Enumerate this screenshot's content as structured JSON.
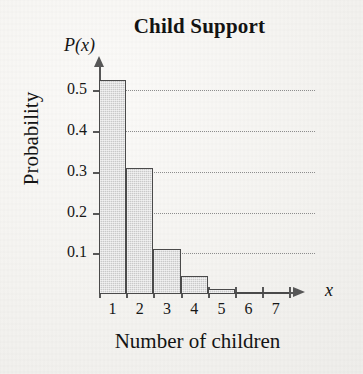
{
  "chart_data": {
    "type": "bar",
    "title": "Child Support",
    "xlabel": "Number of children",
    "ylabel": "Probability",
    "x_var_label": "x",
    "y_var_label": "P(x)",
    "categories": [
      "1",
      "2",
      "3",
      "4",
      "5",
      "6",
      "7"
    ],
    "values": [
      0.525,
      0.31,
      0.11,
      0.045,
      0.012,
      0.006,
      0.0
    ],
    "ylim": [
      0,
      0.56
    ],
    "xlim": [
      0.5,
      7.5
    ],
    "y_ticks": [
      0.1,
      0.2,
      0.3,
      0.4,
      0.5
    ],
    "y_tick_labels": [
      "0.1",
      "0.2",
      "0.3",
      "0.4",
      "0.5"
    ],
    "x_ticks": [
      1,
      2,
      3,
      4,
      5,
      6,
      7
    ],
    "x_tick_labels": [
      "1",
      "2",
      "3",
      "4",
      "5",
      "6",
      "7"
    ],
    "grid": true,
    "grid_axis": "y",
    "legend": null,
    "bar_fill_color": "#c9c9c9",
    "bar_edge_color": "#4a4a4a",
    "axis_color": "#575757",
    "grid_color": "#8d8d8d",
    "background_color": "#f4f3f0"
  }
}
